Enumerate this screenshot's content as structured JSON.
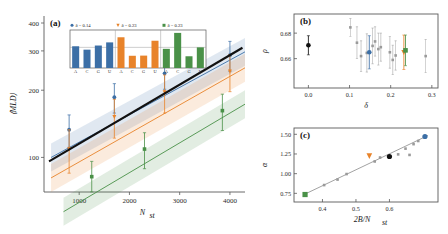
{
  "figure": {
    "panels": [
      "(a)",
      "(b)",
      "(c)"
    ],
    "colors": {
      "blue": "#3c6fa6",
      "orange": "#e8832a",
      "green": "#4a9148",
      "black": "#111111",
      "gray": "#9a9a9a",
      "axis": "#5a5a5a"
    }
  },
  "panel_a": {
    "label": "(a)",
    "ylabel": "⟨MLD⟩",
    "xlabel": "N",
    "xlabel_sub": "st",
    "yticks": [
      100,
      200,
      300,
      400
    ],
    "ytick_labels": [
      "100",
      "200",
      "300",
      "400"
    ],
    "xticks": [
      1000,
      2000,
      3000,
      4000
    ],
    "xtick_labels": [
      "1000",
      "2000",
      "3000",
      "4000"
    ],
    "xlim": [
      300,
      4300
    ],
    "ylim": [
      70,
      430
    ],
    "legend": [
      {
        "marker": "circle",
        "color": "#3c6fa6",
        "label": "δ = 0.14"
      },
      {
        "marker": "triangle-down",
        "color": "#e8832a",
        "label": "δ = 0.23"
      },
      {
        "marker": "square",
        "color": "#4a9148",
        "label": "δ = 0.23"
      }
    ]
  },
  "inset_bars": {
    "groups": [
      {
        "color": "#3c6fa6",
        "categories": [
          "A",
          "C",
          "G",
          "U"
        ],
        "values": [
          0.263,
          0.222,
          0.272,
          0.31
        ]
      },
      {
        "color": "#e8832a",
        "categories": [
          "A",
          "C",
          "G",
          "U"
        ],
        "values": [
          0.372,
          0.148,
          0.15,
          0.33
        ]
      },
      {
        "color": "#4a9148",
        "categories": [
          "A",
          "C",
          "G",
          "U"
        ],
        "values": [
          0.232,
          0.425,
          0.142,
          0.25
        ]
      }
    ],
    "gridline_value": 0.25,
    "ymax": 0.46
  },
  "panel_b": {
    "label": "(b)",
    "ylabel": "ρ",
    "xlabel": "δ",
    "yticks": [
      0.66,
      0.68
    ],
    "ytick_labels": [
      "0.66",
      "0.68"
    ],
    "xticks": [
      0.0,
      0.1,
      0.2,
      0.3
    ],
    "xtick_labels": [
      "0.0",
      "0.1",
      "0.2",
      "0.3"
    ],
    "xlim": [
      -0.035,
      0.315
    ],
    "ylim": [
      0.637,
      0.695
    ]
  },
  "panel_c": {
    "label": "(c)",
    "ylabel": "α",
    "xlabel": "2B/N",
    "xlabel_sub": "st",
    "yticks": [
      0.75,
      1.0,
      1.25,
      1.5
    ],
    "ytick_labels": [
      "0.75",
      "1.00",
      "1.25",
      "1.50"
    ],
    "xticks": [
      0.4,
      0.5,
      0.6
    ],
    "xtick_labels": [
      "0.4",
      "0.5",
      "0.6"
    ],
    "xlim": [
      0.315,
      0.745
    ],
    "ylim": [
      0.64,
      1.58
    ]
  },
  "chart_data": [
    {
      "type": "line",
      "panel": "(a)",
      "title": "",
      "xlabel": "N_st",
      "ylabel": "<MLD>",
      "xlim": [
        300,
        4300
      ],
      "ylim": [
        70,
        430
      ],
      "yscale": "log",
      "grid": false,
      "legend_position": "inset-top",
      "series": [
        {
          "name": "delta = 0.14",
          "color": "#3c6fa6",
          "marker": "circle",
          "x": [
            800,
            1700,
            2700,
            4000
          ],
          "y": [
            133,
            186,
            238,
            287
          ],
          "yerr": [
            22,
            28,
            36,
            44
          ]
        },
        {
          "name": "delta = 0.23",
          "color": "#e8832a",
          "marker": "triangle-down",
          "x": [
            800,
            1700,
            2700,
            4000
          ],
          "y": [
            109,
            152,
            196,
            243
          ],
          "yerr": [
            24,
            30,
            38,
            46
          ]
        },
        {
          "name": "delta = 0.23 (green)",
          "color": "#4a9148",
          "marker": "square",
          "x": [
            1250,
            2300,
            3850
          ],
          "y": [
            82,
            109,
            162
          ],
          "yerr": [
            14,
            20,
            30
          ]
        },
        {
          "name": "reference",
          "color": "#111111",
          "marker": "none",
          "x": [
            400,
            4250
          ],
          "y": [
            96,
            310
          ],
          "yerr": [
            0,
            0
          ]
        }
      ]
    },
    {
      "type": "scatter",
      "panel": "(b)",
      "xlabel": "delta",
      "ylabel": "rho",
      "xlim": [
        -0.035,
        0.315
      ],
      "ylim": [
        0.637,
        0.695
      ],
      "grid": false,
      "points": [
        {
          "x": 0.0,
          "y": 0.6705,
          "yerr": 0.0075,
          "color": "#111111",
          "marker": "circle",
          "size": "large"
        },
        {
          "x": 0.102,
          "y": 0.6845,
          "yerr": 0.007,
          "color": "#9a9a9a",
          "marker": "square",
          "size": "small"
        },
        {
          "x": 0.118,
          "y": 0.6725,
          "yerr": 0.0125,
          "color": "#9a9a9a",
          "marker": "square",
          "size": "small"
        },
        {
          "x": 0.128,
          "y": 0.662,
          "yerr": 0.012,
          "color": "#9a9a9a",
          "marker": "square",
          "size": "small"
        },
        {
          "x": 0.142,
          "y": 0.6645,
          "yerr": 0.015,
          "color": "#9a9a9a",
          "marker": "square",
          "size": "small"
        },
        {
          "x": 0.148,
          "y": 0.665,
          "yerr": 0.013,
          "color": "#3c6fa6",
          "marker": "circle",
          "size": "large"
        },
        {
          "x": 0.156,
          "y": 0.67,
          "yerr": 0.014,
          "color": "#9a9a9a",
          "marker": "square",
          "size": "small"
        },
        {
          "x": 0.162,
          "y": 0.6735,
          "yerr": 0.0115,
          "color": "#9a9a9a",
          "marker": "square",
          "size": "small"
        },
        {
          "x": 0.17,
          "y": 0.6675,
          "yerr": 0.0125,
          "color": "#9a9a9a",
          "marker": "square",
          "size": "small"
        },
        {
          "x": 0.176,
          "y": 0.669,
          "yerr": 0.011,
          "color": "#9a9a9a",
          "marker": "square",
          "size": "small"
        },
        {
          "x": 0.198,
          "y": 0.665,
          "yerr": 0.0125,
          "color": "#9a9a9a",
          "marker": "square",
          "size": "small"
        },
        {
          "x": 0.205,
          "y": 0.659,
          "yerr": 0.0115,
          "color": "#9a9a9a",
          "marker": "square",
          "size": "small"
        },
        {
          "x": 0.212,
          "y": 0.6625,
          "yerr": 0.0115,
          "color": "#9a9a9a",
          "marker": "square",
          "size": "small"
        },
        {
          "x": 0.232,
          "y": 0.665,
          "yerr": 0.0135,
          "color": "#e8832a",
          "marker": "triangle-down",
          "size": "large"
        },
        {
          "x": 0.236,
          "y": 0.6665,
          "yerr": 0.012,
          "color": "#4a9148",
          "marker": "square",
          "size": "large"
        },
        {
          "x": 0.285,
          "y": 0.662,
          "yerr": 0.013,
          "color": "#9a9a9a",
          "marker": "square",
          "size": "small"
        }
      ]
    },
    {
      "type": "scatter",
      "panel": "(c)",
      "xlabel": "2B/N_st",
      "ylabel": "alpha",
      "xlim": [
        0.315,
        0.745
      ],
      "ylim": [
        0.64,
        1.58
      ],
      "grid": false,
      "trendline": {
        "x": [
          0.345,
          0.715
        ],
        "y": [
          0.735,
          1.485
        ],
        "color": "#9a9a9a"
      },
      "points": [
        {
          "x": 0.348,
          "y": 0.735,
          "color": "#4a9148",
          "marker": "square",
          "size": "large"
        },
        {
          "x": 0.405,
          "y": 0.855,
          "color": "#9a9a9a",
          "marker": "square",
          "size": "small"
        },
        {
          "x": 0.445,
          "y": 0.925,
          "color": "#9a9a9a",
          "marker": "square",
          "size": "small"
        },
        {
          "x": 0.472,
          "y": 0.995,
          "color": "#9a9a9a",
          "marker": "square",
          "size": "small"
        },
        {
          "x": 0.54,
          "y": 1.225,
          "color": "#e8832a",
          "marker": "triangle-down",
          "size": "large"
        },
        {
          "x": 0.556,
          "y": 1.155,
          "color": "#9a9a9a",
          "marker": "square",
          "size": "small"
        },
        {
          "x": 0.572,
          "y": 1.205,
          "color": "#9a9a9a",
          "marker": "square",
          "size": "small"
        },
        {
          "x": 0.6,
          "y": 1.218,
          "color": "#111111",
          "marker": "circle",
          "size": "large"
        },
        {
          "x": 0.626,
          "y": 1.245,
          "color": "#9a9a9a",
          "marker": "square",
          "size": "small"
        },
        {
          "x": 0.648,
          "y": 1.318,
          "color": "#9a9a9a",
          "marker": "square",
          "size": "small"
        },
        {
          "x": 0.66,
          "y": 1.238,
          "color": "#9a9a9a",
          "marker": "square",
          "size": "small"
        },
        {
          "x": 0.672,
          "y": 1.375,
          "color": "#9a9a9a",
          "marker": "square",
          "size": "small"
        },
        {
          "x": 0.686,
          "y": 1.415,
          "color": "#9a9a9a",
          "marker": "square",
          "size": "small"
        },
        {
          "x": 0.706,
          "y": 1.472,
          "color": "#3c6fa6",
          "marker": "circle",
          "size": "large"
        }
      ]
    }
  ]
}
